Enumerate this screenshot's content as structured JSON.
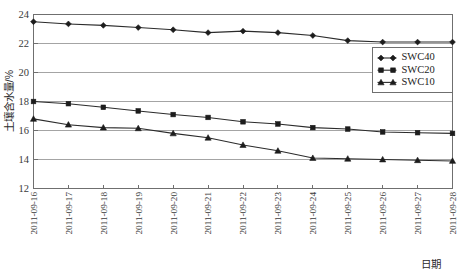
{
  "chart_data": {
    "type": "line",
    "title": "",
    "xlabel": "日期",
    "ylabel": "土壤含水量/%",
    "ylim": [
      12,
      24
    ],
    "ytick_values": [
      12,
      14,
      16,
      18,
      20,
      22,
      24
    ],
    "ytick_labels": [
      "12",
      "14",
      "16",
      "18",
      "20",
      "22",
      "24"
    ],
    "grid": true,
    "grid_axis": "y",
    "legend_position": "upper right",
    "categories": [
      "2011-09-16",
      "2011-09-17",
      "2011-09-18",
      "2011-09-19",
      "2011-09-20",
      "2011-09-21",
      "2011-09-22",
      "2011-09-23",
      "2011-09-24",
      "2011-09-25",
      "2011-09-26",
      "2011-09-27",
      "2011-09-28"
    ],
    "series": [
      {
        "name": "SWC40",
        "marker": "diamond",
        "values": [
          23.5,
          23.35,
          23.25,
          23.1,
          22.95,
          22.75,
          22.85,
          22.75,
          22.55,
          22.2,
          22.1,
          22.1,
          22.1
        ]
      },
      {
        "name": "SWC20",
        "marker": "square",
        "values": [
          18.0,
          17.85,
          17.6,
          17.35,
          17.1,
          16.9,
          16.6,
          16.45,
          16.2,
          16.1,
          15.9,
          15.85,
          15.8
        ]
      },
      {
        "name": "SWC10",
        "marker": "triangle",
        "values": [
          16.8,
          16.4,
          16.2,
          16.15,
          15.8,
          15.5,
          15.0,
          14.6,
          14.1,
          14.05,
          14.0,
          13.95,
          13.9
        ]
      }
    ]
  },
  "axes": {
    "y_title": "土壤含水量/%",
    "x_title": "日期"
  },
  "legend": {
    "entries": [
      {
        "label": "SWC40",
        "marker": "diamond-icon"
      },
      {
        "label": "SWC20",
        "marker": "square-icon"
      },
      {
        "label": "SWC10",
        "marker": "triangle-icon"
      }
    ]
  }
}
